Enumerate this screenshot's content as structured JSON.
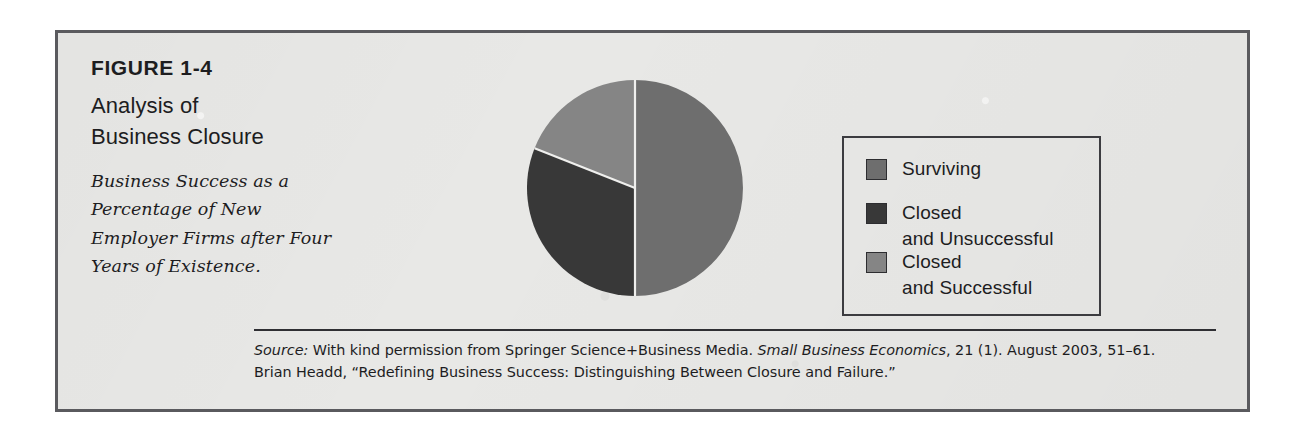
{
  "figure": {
    "number": "FIGURE 1-4",
    "title": "Analysis of\nBusiness Closure",
    "subtitle": "Business Success as a Percentage of New Employer Firms after Four Years of Existence."
  },
  "legend": {
    "items": [
      {
        "label": "Surviving",
        "color": "#6e6e6e"
      },
      {
        "label": "Closed\nand Unsuccessful",
        "color": "#383838"
      },
      {
        "label": "Closed\nand Successful",
        "color": "#858585"
      }
    ]
  },
  "source": {
    "label": "Source:",
    "line1_part1": " With kind permission from Springer Science+Business Media. ",
    "line1_italic": "Small Business Economics",
    "line1_part2": ", 21 (1). August 2003, 51–61.",
    "line2": "Brian Headd, “Redefining Business Success: Distinguishing Between Closure and Failure.”"
  },
  "colors": {
    "paper": "#e8e8e6",
    "frame": "#5a5a5e",
    "ink": "#1d1d1f",
    "slice_surviving": "#6e6e6e",
    "slice_closed_unsuccessful": "#383838",
    "slice_closed_successful": "#858585",
    "slice_divider": "#efefed"
  },
  "chart_data": {
    "type": "pie",
    "title": "Analysis of Business Closure",
    "subtitle": "Business Success as a Percentage of New Employer Firms after Four Years of Existence.",
    "categories": [
      "Surviving",
      "Closed and Unsuccessful",
      "Closed and Successful"
    ],
    "values": [
      50,
      31,
      19
    ],
    "unit": "percent",
    "start_angle_deg": 0,
    "direction": "clockwise",
    "legend_position": "right",
    "labels_shown": false,
    "slices": [
      {
        "name": "Surviving",
        "value": 50,
        "color": "#6e6e6e",
        "start_deg": 0,
        "end_deg": 180
      },
      {
        "name": "Closed and Unsuccessful",
        "value": 31,
        "color": "#383838",
        "start_deg": 180,
        "end_deg": 293
      },
      {
        "name": "Closed and Successful",
        "value": 19,
        "color": "#858585",
        "start_deg": 293,
        "end_deg": 360
      }
    ]
  }
}
